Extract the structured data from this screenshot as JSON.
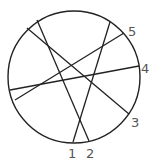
{
  "diagram": {
    "type": "circle-with-chords",
    "stroke_color": "#222222",
    "label_color": "#555555",
    "circle": {
      "cx": 74,
      "cy": 77,
      "r": 66
    },
    "chords": [
      {
        "label": "1",
        "x1": 110,
        "y1": 22,
        "x2": 73,
        "y2": 142,
        "lx": 68,
        "ly": 158
      },
      {
        "label": "2",
        "x1": 37,
        "y1": 20,
        "x2": 89,
        "y2": 141,
        "lx": 86,
        "ly": 158
      },
      {
        "label": "3",
        "x1": 27,
        "y1": 28,
        "x2": 129,
        "y2": 114,
        "lx": 131,
        "ly": 127
      },
      {
        "label": "4",
        "x1": 10,
        "y1": 90,
        "x2": 139,
        "y2": 66,
        "lx": 141,
        "ly": 73
      },
      {
        "label": "5",
        "x1": 15,
        "y1": 100,
        "x2": 124,
        "y2": 33,
        "lx": 128,
        "ly": 36
      }
    ]
  }
}
